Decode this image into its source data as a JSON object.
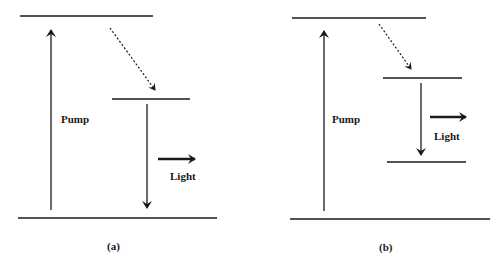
{
  "diagrams": [
    {
      "caption": "(a)",
      "pump_label": "Pump",
      "light_label": "Light"
    },
    {
      "caption": "(b)",
      "pump_label": "Pump",
      "light_label": "Light"
    }
  ],
  "colors": {
    "line": "#1a1a1a",
    "background": "#ffffff"
  }
}
